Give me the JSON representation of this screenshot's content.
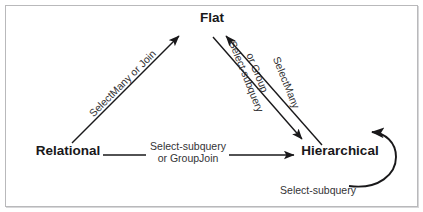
{
  "figure": {
    "type": "directed-graph-diagram",
    "background_color": "#ffffff",
    "border_color": "#b9b9bb",
    "node_text_color": "#19181a",
    "edge_color": "#19181a",
    "edge_label_color": "#333335"
  },
  "nodes": [
    {
      "id": "relational",
      "label": "Relational",
      "x": 68,
      "y": 155
    },
    {
      "id": "flat",
      "label": "Flat",
      "x": 212,
      "y": 22
    },
    {
      "id": "hierarchical",
      "label": "Hierarchical",
      "x": 340,
      "y": 155
    }
  ],
  "edges": [
    {
      "id": "relational-to-flat",
      "from": "relational",
      "to": "flat",
      "label": "SelectMany or Join",
      "label_lines": [
        "SelectMany or Join"
      ],
      "rotation_deg": -45
    },
    {
      "id": "relational-to-hierarchical",
      "from": "relational",
      "to": "hierarchical",
      "label": "Select-subquery or GroupJoin",
      "label_lines": [
        "Select-subquery",
        "or GroupJoin"
      ],
      "rotation_deg": 0
    },
    {
      "id": "flat-to-hierarchical",
      "from": "flat",
      "to": "hierarchical",
      "label": "Select-subquery or Group",
      "label_lines": [
        "Select-subquery",
        "or Group"
      ],
      "rotation_deg": 68
    },
    {
      "id": "hierarchical-to-flat",
      "from": "hierarchical",
      "to": "flat",
      "label": "SelectMany",
      "label_lines": [
        "SelectMany"
      ],
      "rotation_deg": 68
    },
    {
      "id": "hierarchical-to-hierarchical",
      "from": "hierarchical",
      "to": "hierarchical",
      "label": "Select-subquery",
      "label_lines": [
        "Select-subquery"
      ],
      "rotation_deg": 0
    }
  ],
  "labels": {
    "node_relational": "Relational",
    "node_flat": "Flat",
    "node_hierarchical": "Hierarchical",
    "edge_selectmany_or_join": "SelectMany or Join",
    "edge_select_subquery": "Select-subquery",
    "edge_or_groupjoin": "or GroupJoin",
    "edge_select_subquery_2": "Select-subquery",
    "edge_or_group": "or Group",
    "edge_selectmany": "SelectMany",
    "edge_select_subquery_loop": "Select-subquery"
  }
}
